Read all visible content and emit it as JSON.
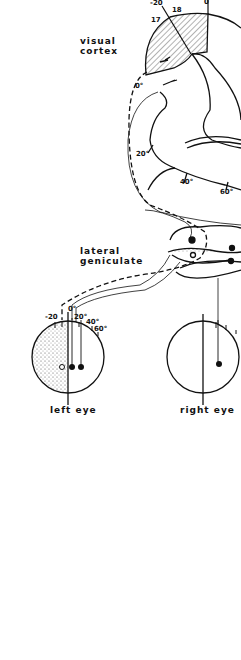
{
  "diagram": {
    "labels": {
      "visual_cortex": [
        "visual",
        "cortex"
      ],
      "lateral_geniculate": [
        "lateral",
        "geniculate"
      ],
      "left_eye": "left eye",
      "right_eye": "right eye"
    },
    "cortex_ticks": {
      "minus20": "-20",
      "area18": "18",
      "area17": "17",
      "zero_top": "0",
      "zero_left": "0°",
      "twenty": "20°",
      "forty": "40°",
      "sixty": "60°"
    },
    "eye_ticks": {
      "minus20": "-20",
      "zero": "0°",
      "twenty": "20°",
      "forty": "40°",
      "sixty": "60°"
    },
    "colors": {
      "ink": "#111111",
      "background": "#ffffff"
    }
  }
}
